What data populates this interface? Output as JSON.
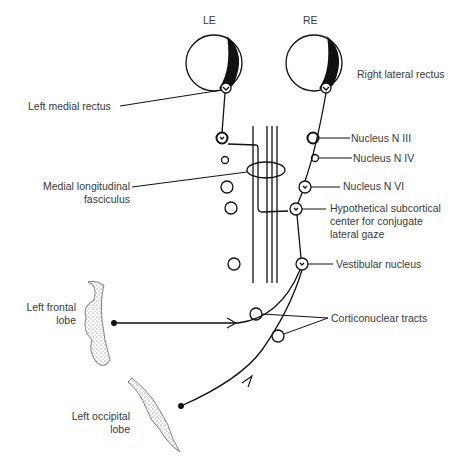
{
  "diagram": {
    "eyes": {
      "left": "LE",
      "right": "RE"
    },
    "labels": {
      "left_medial_rectus": "Left medial rectus",
      "right_lateral_rectus": "Right lateral rectus",
      "nucleus_n3": "Nucleus N III",
      "nucleus_n4": "Nucleus N IV",
      "nucleus_n6": "Nucleus N VI",
      "mlf_line1": "Medial longitudinal",
      "mlf_line2": "fasciculus",
      "gaze_center_line1": "Hypothetical subcortical",
      "gaze_center_line2": "center for conjugate",
      "gaze_center_line3": "lateral gaze",
      "vestibular_nucleus": "Vestibular nucleus",
      "frontal_line1": "Left frontal",
      "frontal_line2": "lobe",
      "corticonuclear": "Corticonuclear tracts",
      "occipital_line1": "Left occipital",
      "occipital_line2": "lobe"
    },
    "colors": {
      "ink": "#111111",
      "text": "#3a3a3a",
      "background": "#ffffff"
    }
  }
}
